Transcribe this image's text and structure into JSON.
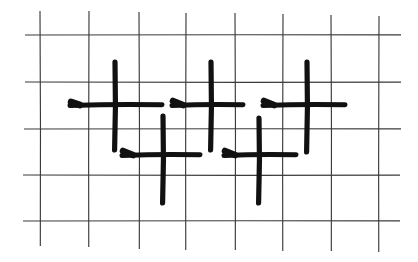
{
  "figure": {
    "canvas": {
      "width": 418,
      "height": 262,
      "background": "#ffffff"
    },
    "colors": {
      "grid_line": "#3b3b3b",
      "mark_ink": "#111111",
      "background": "#ffffff"
    }
  },
  "grid": {
    "name": "ruled-grid",
    "line_color": "#3b3b3b",
    "line_width": 1.15,
    "vertical_count": 8,
    "horizontal_count": 5,
    "vertical_lines": [
      {
        "id": "v1",
        "x": 40,
        "y1": 11,
        "y2": 246
      },
      {
        "id": "v2",
        "x": 89,
        "y1": 11,
        "y2": 247
      },
      {
        "id": "v3",
        "x": 139,
        "y1": 12,
        "y2": 249
      },
      {
        "id": "v4",
        "x": 186,
        "y1": 13,
        "y2": 250
      },
      {
        "id": "v5",
        "x": 235,
        "y1": 13,
        "y2": 250
      },
      {
        "id": "v6",
        "x": 283,
        "y1": 14,
        "y2": 251
      },
      {
        "id": "v7",
        "x": 331,
        "y1": 15,
        "y2": 251
      },
      {
        "id": "v8",
        "x": 379,
        "y1": 16,
        "y2": 252
      }
    ],
    "horizontal_lines": [
      {
        "id": "h1",
        "y": 35,
        "x1": 25,
        "x2": 401
      },
      {
        "id": "h2",
        "y": 82,
        "x1": 25,
        "x2": 401
      },
      {
        "id": "h3",
        "y": 129,
        "x1": 24,
        "x2": 401
      },
      {
        "id": "h4",
        "y": 175,
        "x1": 23,
        "x2": 400
      },
      {
        "id": "h5",
        "y": 221,
        "x1": 23,
        "x2": 400
      }
    ]
  },
  "marks": {
    "count": 5,
    "shape": "plus",
    "ink_color": "#111111",
    "rows": [
      {
        "row": "upper",
        "members": [
          "mark-1",
          "mark-3",
          "mark-5"
        ],
        "horizontal_y": 105
      },
      {
        "row": "lower",
        "members": [
          "mark-2",
          "mark-4"
        ],
        "horizontal_y": 155
      }
    ],
    "items": [
      {
        "id": "mark-1",
        "label": "plus-upper-left",
        "row": "upper",
        "center": {
          "x": 115,
          "y": 105
        },
        "vertical": {
          "x": 115,
          "y1": 62,
          "y2": 150
        },
        "horizontal": {
          "y": 105,
          "x1": 70,
          "x2": 162
        },
        "hook": {
          "x1": 71,
          "y1": 102,
          "x2": 80,
          "y2": 105
        }
      },
      {
        "id": "mark-2",
        "label": "plus-lower-left",
        "row": "lower",
        "center": {
          "x": 163,
          "y": 155
        },
        "vertical": {
          "x": 163,
          "y1": 116,
          "y2": 203
        },
        "horizontal": {
          "y": 155,
          "x1": 122,
          "x2": 200
        },
        "hook": {
          "x1": 123,
          "y1": 151,
          "x2": 133,
          "y2": 155
        }
      },
      {
        "id": "mark-3",
        "label": "plus-upper-middle",
        "row": "upper",
        "center": {
          "x": 211,
          "y": 105
        },
        "vertical": {
          "x": 211,
          "y1": 62,
          "y2": 150
        },
        "horizontal": {
          "y": 105,
          "x1": 172,
          "x2": 243
        },
        "hook": {
          "x1": 173,
          "y1": 101,
          "x2": 183,
          "y2": 105
        }
      },
      {
        "id": "mark-4",
        "label": "plus-lower-middle",
        "row": "lower",
        "center": {
          "x": 259,
          "y": 155
        },
        "vertical": {
          "x": 259,
          "y1": 118,
          "y2": 203
        },
        "horizontal": {
          "y": 155,
          "x1": 224,
          "x2": 296
        },
        "hook": {
          "x1": 225,
          "y1": 151,
          "x2": 235,
          "y2": 155
        }
      },
      {
        "id": "mark-5",
        "label": "plus-upper-right",
        "row": "upper",
        "center": {
          "x": 307,
          "y": 105
        },
        "vertical": {
          "x": 307,
          "y1": 62,
          "y2": 152
        },
        "horizontal": {
          "y": 105,
          "x1": 263,
          "x2": 345
        },
        "hook": {
          "x1": 264,
          "y1": 101,
          "x2": 274,
          "y2": 105
        }
      }
    ]
  },
  "chart_data": {
    "type": "scatter",
    "xlabel": "",
    "ylabel": "",
    "xlim": [
      0,
      418
    ],
    "ylim": [
      0,
      262
    ],
    "grid": true,
    "legend": "none",
    "marker": "plus",
    "x": [
      115,
      163,
      211,
      259,
      307
    ],
    "y": [
      105,
      155,
      105,
      155,
      105
    ],
    "point_labels": [
      "plus-upper-left",
      "plus-lower-left",
      "plus-upper-middle",
      "plus-lower-middle",
      "plus-upper-right"
    ],
    "gridlines_x": [
      40,
      89,
      139,
      186,
      235,
      283,
      331,
      379
    ],
    "gridlines_y": [
      35,
      82,
      129,
      175,
      221
    ],
    "tick_labels_x": [],
    "tick_labels_y": [],
    "annotations": []
  }
}
